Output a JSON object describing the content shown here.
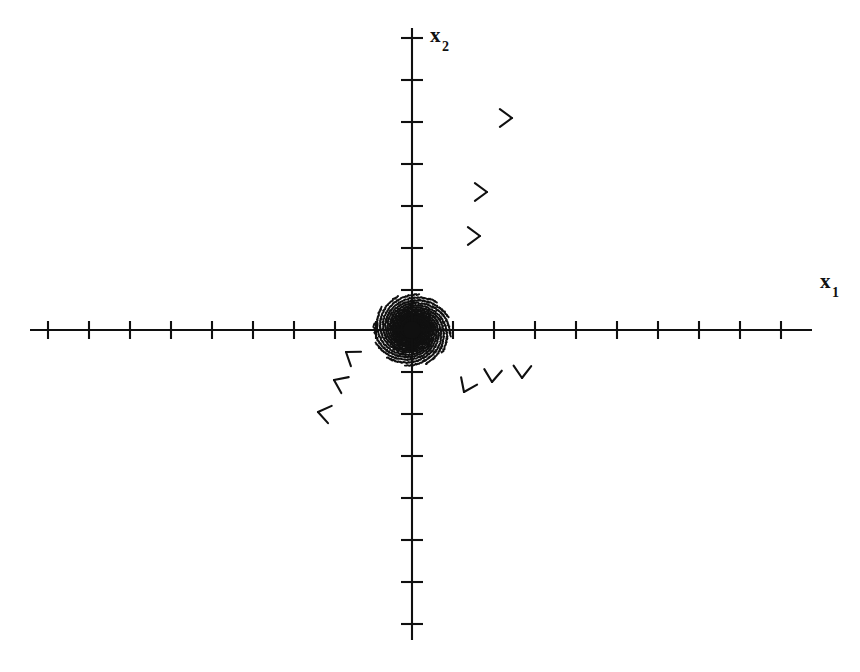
{
  "figure": {
    "kind": "phase-portrait",
    "background_color": "#ffffff",
    "line_color": "#101010"
  },
  "axes": {
    "horizontal": {
      "name": "x1-axis",
      "label": "x",
      "subscript": "1",
      "label_x": 820,
      "label_y": 288,
      "y_pixel": 330,
      "x_start": 30,
      "x_end": 812,
      "tick_half_height": 9,
      "tick_positions": [
        48,
        89,
        130,
        171,
        212,
        253,
        294,
        335,
        376,
        453,
        494,
        535,
        576,
        617,
        658,
        699,
        740,
        781
      ],
      "tick_count": 18
    },
    "vertical": {
      "name": "x2-axis",
      "label": "x",
      "subscript": "2",
      "label_x": 430,
      "label_y": 42,
      "x_pixel": 412,
      "y_start": 28,
      "y_end": 640,
      "tick_half_width": 11,
      "tick_positions": [
        38,
        80,
        122,
        164,
        206,
        248,
        290,
        372,
        414,
        456,
        498,
        540,
        582,
        624
      ],
      "tick_count": 14
    },
    "origin": {
      "x": 412,
      "y": 330
    }
  },
  "equilibrium": {
    "name": "unstable-focus",
    "type": "spiral source",
    "stability": "unstable",
    "rotation": "clockwise",
    "x": 412,
    "y": 330,
    "dot_radius": 9
  },
  "chart_data": {
    "type": "line",
    "title": "",
    "xlabel": "x1",
    "ylabel": "x2",
    "grid": false,
    "legend": false,
    "spiral_model": {
      "family": "logarithmic spiral",
      "equation_r": "r(t) = r0 * exp(k * t)",
      "growth_rate_k": 0.175,
      "angular_direction": "clockwise",
      "center_x": 412,
      "center_y": 330,
      "x_scale": 1.0,
      "y_scale": 0.93,
      "theta_start_rad": 0.0,
      "theta_end_rad": 16.4,
      "r0": 2.2,
      "n_trajectories": 12,
      "phase_offsets_rad": [
        0.0,
        0.5236,
        1.0472,
        1.5708,
        2.0944,
        2.618,
        3.1416,
        3.6652,
        4.1888,
        4.7124,
        5.236,
        5.7596
      ]
    },
    "arrows": [
      {
        "name": "arrow-upper-right-outer",
        "x": 512,
        "y": 118,
        "angle_deg": 0
      },
      {
        "name": "arrow-upper-right-mid",
        "x": 487,
        "y": 192,
        "angle_deg": 0
      },
      {
        "name": "arrow-upper-right-inner",
        "x": 480,
        "y": 236,
        "angle_deg": 0
      },
      {
        "name": "arrow-lower-right-a",
        "x": 464,
        "y": 392,
        "angle_deg": 115
      },
      {
        "name": "arrow-lower-right-b",
        "x": 492,
        "y": 382,
        "angle_deg": 95
      },
      {
        "name": "arrow-lower-right-c",
        "x": 522,
        "y": 378,
        "angle_deg": 92
      },
      {
        "name": "arrow-lower-left-inner",
        "x": 346,
        "y": 352,
        "angle_deg": 215
      },
      {
        "name": "arrow-lower-left-mid",
        "x": 334,
        "y": 380,
        "angle_deg": 205
      },
      {
        "name": "arrow-lower-left-outer",
        "x": 318,
        "y": 412,
        "angle_deg": 192
      }
    ],
    "arrow_count": 9
  }
}
